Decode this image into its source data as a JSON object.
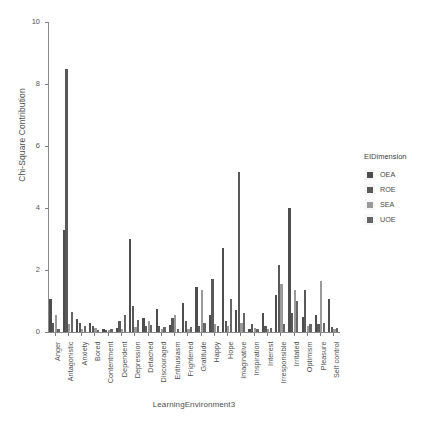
{
  "chart_data": {
    "type": "bar",
    "title": "",
    "xlabel": "LearningEnvironment3",
    "ylabel": "Chi-Square Contribution",
    "ylim": [
      0,
      10
    ],
    "yticks": [
      "0",
      "2",
      "4",
      "6",
      "8",
      "10"
    ],
    "grid": false,
    "legend_position": "right",
    "legend_title": "EIDimension",
    "categories": [
      "Anger",
      "Antagonistic",
      "Anxiety",
      "Bored",
      "Contentment",
      "Dependent",
      "Depression",
      "Detached",
      "Discouraged",
      "Enthusiasm",
      "Frightened",
      "Gratitude",
      "Happy",
      "Hope",
      "Imaginative",
      "Inspiration",
      "Interest",
      "Irresponsible",
      "Irritated",
      "Optimism",
      "Pleasure",
      "Self control"
    ],
    "series": [
      {
        "name": "OEA",
        "color": "#4d4d4d",
        "values": [
          1.05,
          3.3,
          0.42,
          0.3,
          0.1,
          0.12,
          3.0,
          0.45,
          0.75,
          0.22,
          0.95,
          1.45,
          0.55,
          2.7,
          0.7,
          0.1,
          0.6,
          1.2,
          4.0,
          0.5,
          0.55,
          1.05
        ]
      },
      {
        "name": "ROE",
        "color": "#595959",
        "values": [
          0.28,
          8.5,
          0.3,
          0.18,
          0.05,
          0.35,
          0.85,
          0.18,
          0.2,
          0.45,
          0.35,
          0.2,
          1.7,
          0.35,
          5.15,
          0.25,
          0.2,
          2.15,
          0.6,
          1.35,
          0.25,
          0.15
        ]
      },
      {
        "name": "SEA",
        "color": "#9a9a9a",
        "values": [
          0.55,
          0.25,
          0.1,
          0.12,
          0.08,
          0.1,
          0.15,
          0.35,
          0.1,
          0.55,
          0.1,
          1.35,
          0.25,
          0.2,
          0.3,
          0.12,
          0.1,
          1.55,
          1.35,
          0.2,
          1.65,
          0.1
        ]
      },
      {
        "name": "UOE",
        "color": "#666666",
        "values": [
          0.1,
          0.65,
          0.2,
          0.08,
          0.1,
          0.55,
          0.4,
          0.22,
          0.15,
          0.1,
          0.15,
          0.3,
          0.2,
          1.05,
          0.6,
          0.1,
          0.12,
          0.25,
          1.0,
          0.25,
          0.3,
          0.12
        ]
      }
    ]
  },
  "legend": {
    "title": "EIDimension",
    "items": [
      {
        "label": "OEA",
        "color": "#4d4d4d"
      },
      {
        "label": "ROE",
        "color": "#595959"
      },
      {
        "label": "SEA",
        "color": "#9a9a9a"
      },
      {
        "label": "UOE",
        "color": "#666666"
      }
    ]
  },
  "axes": {
    "y_title": "Chi-Square Contribution",
    "x_title": "LearningEnvironment3"
  }
}
